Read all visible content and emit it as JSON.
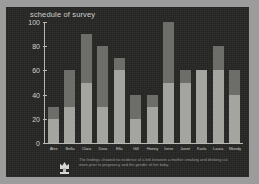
{
  "chart": {
    "title": "schedule of survey"
  },
  "footer": {
    "icon": "trophy-icon",
    "caption": "The findings showed no evidence of a link between a mother smoking and drinking cut more prior to pregnancy and the gender of her baby."
  },
  "colors": {
    "slide_background": "#262625",
    "page_border": "#9c9c9c",
    "axis": "#b9b9b4",
    "title_text": "#cfcfcc",
    "segment_lower": "#a5a5a0",
    "segment_upper": "#6d6d6a"
  },
  "chart_data": {
    "type": "bar",
    "title": "schedule of survey",
    "xlabel": "",
    "ylabel": "",
    "ylim": [
      0,
      100
    ],
    "yticks": [
      0,
      20,
      40,
      60,
      80,
      100
    ],
    "grid": false,
    "stacked": true,
    "legend": "none",
    "categories": [
      "Alex",
      "Bella",
      "Clara",
      "Dora",
      "Ella",
      "Gill",
      "Honey",
      "Irene",
      "Janet",
      "Karla",
      "Laura",
      "Mandy"
    ],
    "series": [
      {
        "name": "lower",
        "values": [
          20,
          30,
          50,
          30,
          60,
          20,
          30,
          50,
          50,
          60,
          60,
          40
        ]
      },
      {
        "name": "upper",
        "values": [
          10,
          30,
          40,
          50,
          10,
          20,
          10,
          50,
          10,
          0,
          20,
          20
        ]
      }
    ],
    "totals": [
      30,
      60,
      90,
      80,
      70,
      40,
      40,
      100,
      60,
      60,
      80,
      60
    ]
  }
}
